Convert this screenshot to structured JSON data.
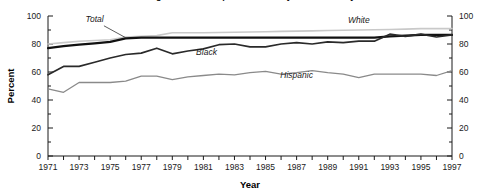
{
  "chart_data": {
    "type": "line",
    "title": "High school completion rates by race/ethnicity",
    "xlabel": "Year",
    "ylabel": "Percent",
    "xlim": [
      1971,
      1997
    ],
    "ylim": [
      0,
      100
    ],
    "ytick_step": 20,
    "yminor_step": 10,
    "xtick_step": 1,
    "xlabel_step": 2,
    "grid": false,
    "legend": "inline-annotations",
    "dual_y_axis": true,
    "x": [
      1971,
      1972,
      1973,
      1974,
      1975,
      1976,
      1977,
      1978,
      1979,
      1980,
      1981,
      1982,
      1983,
      1984,
      1985,
      1986,
      1987,
      1988,
      1989,
      1990,
      1991,
      1992,
      1993,
      1994,
      1995,
      1996,
      1997
    ],
    "ytick_labels": [
      "0",
      "20",
      "40",
      "60",
      "80",
      "100"
    ],
    "ytick_values": [
      0,
      20,
      40,
      60,
      80,
      100
    ],
    "xtick_labels": [
      "1971",
      "1973",
      "1975",
      "1977",
      "1979",
      "1981",
      "1983",
      "1985",
      "1987",
      "1989",
      "1991",
      "1993",
      "1995",
      "1997"
    ],
    "xtick_values": [
      1971,
      1973,
      1975,
      1977,
      1979,
      1981,
      1983,
      1985,
      1987,
      1989,
      1991,
      1993,
      1995,
      1997
    ],
    "series": [
      {
        "name": "White",
        "color": "#c9c9c9",
        "width": 1.6,
        "label": "White",
        "label_x": 1991.0,
        "label_y": 95.0,
        "values": [
          80.0,
          81.0,
          82.0,
          82.5,
          83.0,
          85.0,
          85.5,
          86.0,
          88.0,
          88.0,
          88.0,
          88.2,
          88.4,
          88.6,
          88.8,
          89.0,
          89.2,
          89.4,
          89.6,
          89.8,
          90.0,
          90.2,
          90.4,
          90.6,
          91.0,
          91.0,
          91.0
        ]
      },
      {
        "name": "Total",
        "color": "#111111",
        "width": 2.2,
        "label": "Total",
        "label_x": 1974.0,
        "label_y": 95.5,
        "leader": {
          "x1": 1974.6,
          "y1": 93.0,
          "x2": 1976.0,
          "y2": 84.5
        },
        "values": [
          77.0,
          78.5,
          79.5,
          80.5,
          81.5,
          84.0,
          84.5,
          84.5,
          84.5,
          84.5,
          84.5,
          84.5,
          84.5,
          84.5,
          84.5,
          84.5,
          84.5,
          84.5,
          84.5,
          84.5,
          84.5,
          84.5,
          85.5,
          86.0,
          86.5,
          86.5,
          86.5
        ]
      },
      {
        "name": "Black",
        "color": "#2a2a2a",
        "width": 1.7,
        "label": "Black",
        "label_x": 1981.2,
        "label_y": 72.0,
        "values": [
          58.0,
          64.0,
          64.0,
          67.0,
          70.0,
          72.5,
          73.5,
          77.0,
          73.0,
          75.0,
          76.5,
          79.5,
          80.0,
          78.0,
          78.0,
          80.0,
          81.0,
          80.0,
          81.5,
          81.0,
          82.0,
          82.0,
          87.0,
          85.5,
          87.0,
          85.0,
          86.5
        ]
      },
      {
        "name": "Hispanic",
        "color": "#8a8a8a",
        "width": 1.3,
        "label": "Hispanic",
        "label_x": 1987.0,
        "label_y": 56.0,
        "values": [
          48.0,
          45.5,
          52.5,
          52.5,
          52.5,
          53.5,
          57.0,
          57.0,
          54.5,
          56.5,
          57.5,
          58.5,
          58.0,
          59.5,
          60.5,
          58.5,
          59.5,
          61.0,
          59.5,
          58.5,
          56.0,
          58.5,
          58.5,
          58.5,
          58.5,
          57.5,
          61.0
        ]
      }
    ]
  },
  "axes": {
    "left_axis_name": "left-y-axis",
    "right_axis_name": "right-y-axis",
    "bottom_axis_name": "x-axis"
  }
}
